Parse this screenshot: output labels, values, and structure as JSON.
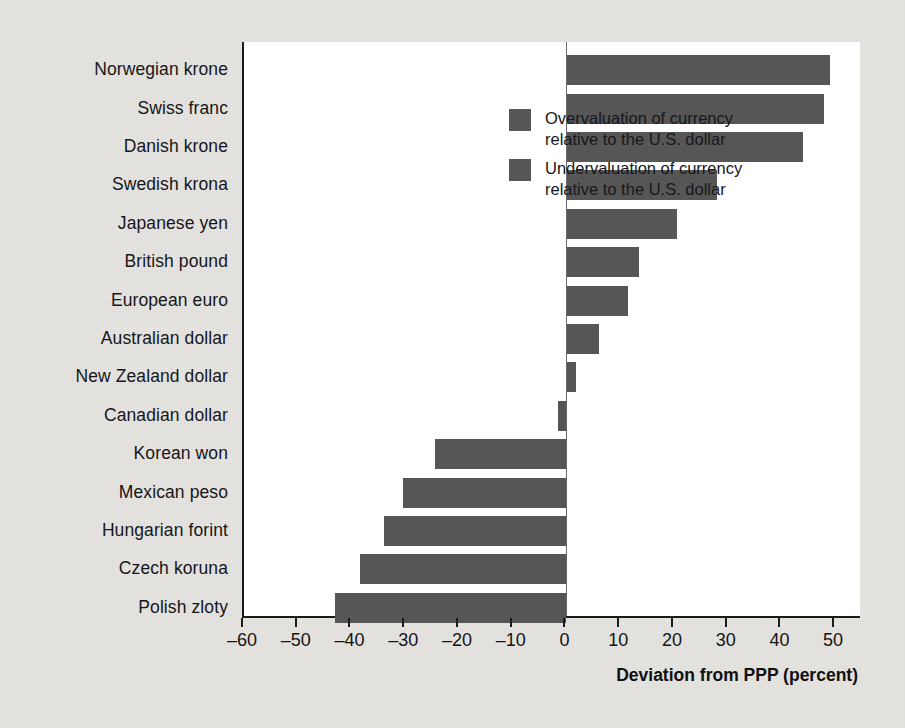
{
  "chart_data": {
    "type": "bar",
    "orientation": "horizontal",
    "title": "",
    "xlabel": "Deviation from PPP (percent)",
    "ylabel": "",
    "xlim": [
      -60,
      55
    ],
    "xticks": [
      -60,
      -50,
      -40,
      -30,
      -20,
      -10,
      0,
      10,
      20,
      30,
      40,
      50
    ],
    "xtick_labels": [
      "–60",
      "–50",
      "–40",
      "–30",
      "–20",
      "–10",
      "0",
      "10",
      "20",
      "30",
      "40",
      "50"
    ],
    "grid": false,
    "legend_position": "top-left-inside",
    "legend": [
      {
        "label_line1": "Overvaluation of currency",
        "label_line2": "relative to the U.S. dollar",
        "color": "#565656"
      },
      {
        "label_line1": "Undervaluation of currency",
        "label_line2": "relative to the U.S. dollar",
        "color": "#565656"
      }
    ],
    "categories": [
      "Norwegian krone",
      "Swiss franc",
      "Danish krone",
      "Swedish krona",
      "Japanese yen",
      "British pound",
      "European euro",
      "Australian dollar",
      "New Zealand dollar",
      "Canadian dollar",
      "Korean won",
      "Mexican peso",
      "Hungarian forint",
      "Czech koruna",
      "Polish zloty"
    ],
    "values": [
      49,
      48,
      44,
      28,
      20.5,
      13.5,
      11.5,
      6,
      1.8,
      -1.5,
      -24.5,
      -30.5,
      -34,
      -38.5,
      -43
    ],
    "bar_color": "#565656",
    "zero_reference": 0
  },
  "axis": {
    "xtitle": "Deviation from PPP (percent)"
  }
}
